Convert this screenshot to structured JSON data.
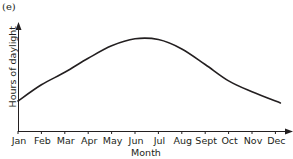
{
  "figure": {
    "label": "(e)"
  },
  "chart_data": {
    "type": "line",
    "title": "",
    "xlabel": "Month",
    "ylabel": "Hours of daylight",
    "categories": [
      "Jan",
      "Feb",
      "Mar",
      "Apr",
      "May",
      "Jun",
      "Jul",
      "Aug",
      "Sept",
      "Oct",
      "Nov",
      "Dec"
    ],
    "series": [
      {
        "name": "Hours of daylight (relative, 0-1)",
        "values": [
          0.28,
          0.4,
          0.56,
          0.74,
          0.9,
          0.99,
          0.98,
          0.86,
          0.66,
          0.45,
          0.31,
          0.26
        ]
      }
    ],
    "grid": false,
    "legend": null,
    "y_ticks": "none"
  },
  "axis": {
    "ticks": [
      "Jan",
      "Feb",
      "Mar",
      "Apr",
      "May",
      "Jun",
      "Jul",
      "Aug",
      "Sept",
      "Oct",
      "Nov",
      "Dec"
    ]
  },
  "colors": {
    "ink": "#231f20",
    "background": "#ffffff"
  }
}
